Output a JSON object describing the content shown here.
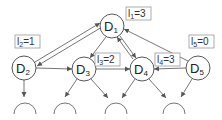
{
  "diagram": {
    "type": "directed-graph",
    "nodes": [
      {
        "id": "D1",
        "base": "D",
        "sub": "1",
        "cx": 112,
        "cy": 26
      },
      {
        "id": "D2",
        "base": "D",
        "sub": "2",
        "cx": 24,
        "cy": 68
      },
      {
        "id": "D3",
        "base": "D",
        "sub": "3",
        "cx": 84,
        "cy": 69
      },
      {
        "id": "D4",
        "base": "D",
        "sub": "4",
        "cx": 142,
        "cy": 69
      },
      {
        "id": "D5",
        "base": "D",
        "sub": "5",
        "cx": 198,
        "cy": 68
      }
    ],
    "labels": [
      {
        "base": "l",
        "sub": "1",
        "value": "=3",
        "text": "l1=3",
        "x": 127,
        "y": 12
      },
      {
        "base": "l",
        "sub": "2",
        "value": "=1",
        "text": "l2=1",
        "x": 16,
        "y": 40
      },
      {
        "base": "l",
        "sub": "3",
        "value": "=2",
        "text": "l3=2",
        "x": 96,
        "y": 54
      },
      {
        "base": "l",
        "sub": "4",
        "value": "=3",
        "text": "l4=3",
        "x": 156,
        "y": 54
      },
      {
        "base": "l",
        "sub": "5",
        "value": "=0",
        "text": "l5=0",
        "x": 190,
        "y": 40
      }
    ],
    "edges": [
      {
        "from": "D2",
        "to": "D1",
        "style": "double",
        "direction": "both"
      },
      {
        "from": "D4",
        "to": "D1",
        "style": "double",
        "direction": "both"
      },
      {
        "from": "D5",
        "to": "D1",
        "style": "single",
        "direction": "to-D1"
      },
      {
        "from": "D1",
        "to": "D3",
        "style": "single",
        "direction": "to-D3"
      },
      {
        "from": "D2",
        "to": "D3",
        "style": "single",
        "direction": "to-D3"
      },
      {
        "from": "D3",
        "to": "D4",
        "style": "single",
        "direction": "to-D4"
      },
      {
        "from": "D5",
        "to": "D4",
        "style": "single",
        "direction": "to-D4"
      },
      {
        "from": "D2",
        "to": "child-1",
        "style": "single"
      },
      {
        "from": "D3",
        "to": "child-2",
        "style": "single"
      },
      {
        "from": "D3",
        "to": "child-3",
        "style": "single"
      },
      {
        "from": "D4",
        "to": "child-3",
        "style": "single"
      },
      {
        "from": "D4",
        "to": "child-4",
        "style": "single"
      },
      {
        "from": "D5",
        "to": "child-4",
        "style": "single"
      }
    ],
    "colors": {
      "line": "#555555",
      "node_stroke": "#444444",
      "node_fill": "#ffffff",
      "label_border": "#999999",
      "text": "#222222"
    }
  }
}
